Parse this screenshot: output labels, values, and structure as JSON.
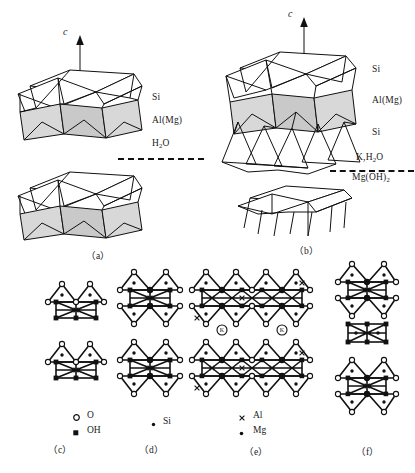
{
  "figure": {
    "type": "crystal-structure-diagram",
    "axis_label": "c"
  },
  "panels": [
    {
      "id": "a",
      "caption": "（a）",
      "axis_label": "c",
      "layer_labels": [
        "Si",
        "Al(Mg)",
        "H2O"
      ],
      "layer_labels_rich": [
        {
          "text": "Si"
        },
        {
          "text": "Al(Mg)"
        },
        {
          "base": "H",
          "sub": "2",
          "post": "O"
        }
      ],
      "interlayer_above": "H2O",
      "interlayer_below": ""
    },
    {
      "id": "b",
      "caption": "（b）",
      "axis_label": "c",
      "layer_labels": [
        "Si",
        "Al(Mg)",
        "Si"
      ],
      "interlayer_above": "K,H2O",
      "interlayer_above_rich": {
        "pre": "K,H",
        "sub": "2",
        "post": "O"
      },
      "interlayer_below": "Mg(OH)2",
      "interlayer_below_rich": {
        "pre": "Mg(OH)",
        "sub": "2",
        "post": ""
      }
    },
    {
      "id": "c",
      "caption": "（c）"
    },
    {
      "id": "d",
      "caption": "（d）"
    },
    {
      "id": "e",
      "caption": "（e）",
      "interlayer_ion": "K"
    },
    {
      "id": "f",
      "caption": "（f）"
    }
  ],
  "legend": {
    "columns": [
      {
        "items": [
          {
            "symbol": "open-circle",
            "label": "O"
          },
          {
            "symbol": "filled-square",
            "label": "OH"
          }
        ]
      },
      {
        "items": [
          {
            "symbol": "small-dot",
            "label": "Si"
          }
        ]
      },
      {
        "items": [
          {
            "symbol": "cross",
            "label": "Al"
          },
          {
            "symbol": "small-dot",
            "label": "Mg"
          }
        ]
      }
    ]
  },
  "colors": {
    "ink": "#111111",
    "shade_light": "#d8d8d8",
    "shade_mid": "#c9c9c9",
    "background": "#ffffff"
  }
}
